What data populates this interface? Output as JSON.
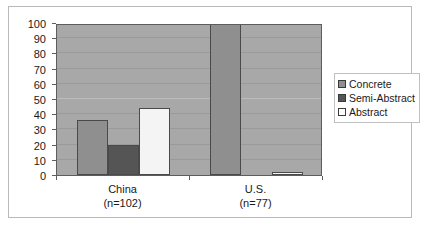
{
  "chart_data": {
    "type": "bar",
    "title": "",
    "xlabel": "",
    "ylabel": "",
    "ylim": [
      0,
      100
    ],
    "yticks": [
      0,
      10,
      20,
      30,
      40,
      50,
      60,
      70,
      80,
      90,
      100
    ],
    "grid": true,
    "legend_position": "right",
    "categories": [
      "China",
      "U.S."
    ],
    "category_labels": [
      {
        "name": "China",
        "n": "(n=102)"
      },
      {
        "name": "U.S.",
        "n": "(n=77)"
      }
    ],
    "series": [
      {
        "name": "Concrete",
        "values": [
          36,
          100
        ],
        "color": "#8f8f8f"
      },
      {
        "name": "Semi-Abstract",
        "values": [
          20,
          0
        ],
        "color": "#555555"
      },
      {
        "name": "Abstract",
        "values": [
          44,
          1
        ],
        "color": "#f4f4f4"
      }
    ]
  },
  "legend": {
    "items": [
      {
        "label": "Concrete"
      },
      {
        "label": "Semi-Abstract"
      },
      {
        "label": "Abstract"
      }
    ]
  },
  "axis": {
    "y_tick_labels": [
      "100",
      "90",
      "80",
      "70",
      "60",
      "50",
      "40",
      "30",
      "20",
      "10",
      "0"
    ]
  }
}
